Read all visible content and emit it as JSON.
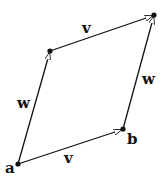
{
  "diagram": {
    "type": "vector parallelogram",
    "points": {
      "a": {
        "label": "a",
        "x": 18,
        "y": 164
      },
      "b": {
        "label": "b",
        "x": 123,
        "y": 129
      },
      "top_left": {
        "x": 50,
        "y": 51
      },
      "top_right": {
        "x": 154,
        "y": 15
      }
    },
    "edges": [
      {
        "from": "a",
        "to": "b",
        "label": "v"
      },
      {
        "from": "a",
        "to": "top_left",
        "label": "w"
      },
      {
        "from": "top_left",
        "to": "top_right",
        "label": "v"
      },
      {
        "from": "b",
        "to": "top_right",
        "label": "w"
      }
    ],
    "labels": {
      "a": "a",
      "b": "b",
      "v_bottom": "v",
      "v_top": "v",
      "w_left": "w",
      "w_right": "w"
    },
    "colors": {
      "line": "#111111",
      "background": "#ffffff"
    }
  }
}
